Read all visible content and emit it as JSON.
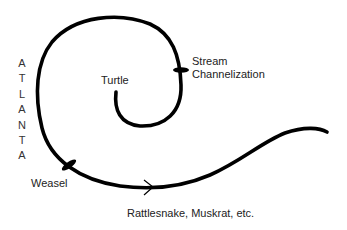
{
  "diagram": {
    "vertical_label": {
      "text": "ATLANTA",
      "letters": [
        "A",
        "T",
        "L",
        "A",
        "N",
        "T",
        "A"
      ]
    },
    "labels": {
      "turtle": "Turtle",
      "stream_line1": "Stream",
      "stream_line2": "Channelization",
      "weasel": "Weasel",
      "rattlesnake": "Rattlesnake, Muskrat, etc."
    },
    "colors": {
      "line": "#000000",
      "text": "#222222",
      "background": "#ffffff"
    }
  }
}
